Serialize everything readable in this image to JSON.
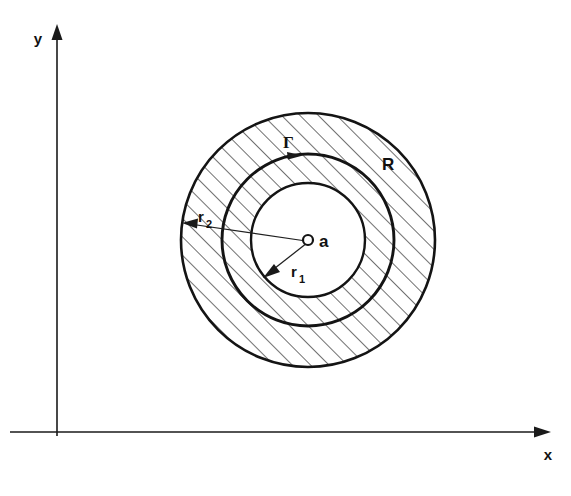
{
  "figure": {
    "background_color": "#ffffff",
    "ink_color": "#141414"
  },
  "axes": {
    "x": {
      "label": "x",
      "icon": "arrow-right-icon",
      "start_x": 10,
      "end_x": 545,
      "y": 432
    },
    "y": {
      "label": "y",
      "icon": "arrow-up-icon",
      "x": 57,
      "start_y": 435,
      "end_y": 25
    }
  },
  "center": {
    "label": "a",
    "marker": "open-circle-marker",
    "cx": 308,
    "cy": 240,
    "marker_radius": 5
  },
  "circles": [
    {
      "name": "outer-boundary",
      "label": "",
      "radius": 128,
      "radius_symbol": "r2",
      "stroke_width": 2.6
    },
    {
      "name": "contour-gamma",
      "label": "Γ",
      "radius": 87,
      "radius_symbol": "",
      "stroke_width": 2.9
    },
    {
      "name": "inner-boundary",
      "label": "",
      "radius": 58,
      "radius_symbol": "r1",
      "stroke_width": 2.4
    }
  ],
  "labels": {
    "r2": {
      "base": "r",
      "sub": "2",
      "x": 198,
      "y": 222
    },
    "r1": {
      "base": "r",
      "sub": "1",
      "x": 291,
      "y": 277
    },
    "gamma": {
      "text": "Γ",
      "x": 283,
      "y": 148
    },
    "region": {
      "text": "R",
      "x": 382,
      "y": 170
    }
  },
  "hatching": {
    "angle_degrees": 45,
    "spacing_px": 13,
    "stroke_width": 1.25,
    "regions": [
      "outer-annulus",
      "middle-annulus"
    ],
    "unhatched_regions": [
      "inner-disk"
    ]
  },
  "leaders": [
    {
      "name": "r2-leader",
      "from_label": "r2",
      "to": "outer-boundary",
      "arrow": "arrow-head"
    },
    {
      "name": "r1-leader",
      "from_label": "r1",
      "to": "inner-boundary",
      "arrow": "arrow-head"
    },
    {
      "name": "gamma-leader",
      "from_label": "gamma",
      "to": "contour-gamma",
      "arrow": "arrow-head"
    }
  ]
}
